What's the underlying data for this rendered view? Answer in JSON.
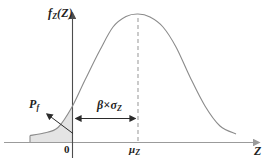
{
  "diagram": {
    "labels": {
      "y_axis": {
        "base": "f",
        "sub": "Z",
        "arg": "(Z)"
      },
      "x_axis": "Z",
      "origin": "0",
      "mean": {
        "base": "μ",
        "sub": "Z"
      },
      "failure_prob": {
        "base": "P",
        "sub": "f"
      },
      "beta_sigma": {
        "base": "β×σ",
        "sub": "Z"
      }
    },
    "colors": {
      "text": "#1f1f1f",
      "annotation": "#2b2b2b",
      "curve": "#8b8b8b",
      "axis_x": "#9b9b9b",
      "axis_y": "#4d4d4d",
      "dashed": "#a0a0a0",
      "shade": "#e4e4e4"
    }
  },
  "chart_data": {
    "type": "line",
    "curve": "normal-pdf-sketch",
    "title": "",
    "xlabel": "Z",
    "ylabel": "fZ(Z)",
    "landmarks": {
      "origin_tick": "0",
      "mean_tick": "μZ",
      "distance_origin_to_mean": "β×σZ",
      "shaded_tail_left_of_origin": "Pf"
    }
  },
  "geometry": {
    "canvas": {
      "w": 273,
      "h": 167
    },
    "baseline_y": 142.5,
    "x_axis": {
      "x1": 4,
      "y": 142.5,
      "x2": 259
    },
    "y_axis": {
      "x": 72.5,
      "y1": 158,
      "y2": 13
    },
    "curve_points": [
      [
        30,
        135.5
      ],
      [
        44,
        133
      ],
      [
        58,
        127.5
      ],
      [
        72,
        107
      ],
      [
        85,
        80
      ],
      [
        100,
        50
      ],
      [
        113,
        27
      ],
      [
        126,
        16.5
      ],
      [
        138,
        14
      ],
      [
        150,
        17
      ],
      [
        163,
        27
      ],
      [
        176,
        47
      ],
      [
        190,
        77
      ],
      [
        205,
        106
      ],
      [
        220,
        126
      ],
      [
        236,
        134
      ]
    ],
    "shade_clip_right_x": 72.5,
    "shade_left_edge": {
      "x": 30,
      "y1": 135.5,
      "y2": 142.5
    },
    "dashed_line": {
      "x": 138,
      "y1": 18,
      "y2": 141
    },
    "beta_arrow": {
      "x1": 76,
      "x2": 135,
      "y": 118.5
    },
    "pf_arrow": {
      "x1": 47,
      "y1": 114,
      "x2": 73,
      "y2": 133.5
    }
  }
}
